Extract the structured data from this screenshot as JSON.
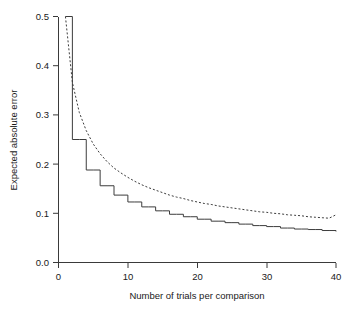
{
  "chart_data": {
    "type": "line",
    "title": "",
    "xlabel": "Number of trials per comparison",
    "ylabel": "Expected absolute error",
    "xlim": [
      0,
      40
    ],
    "ylim": [
      0.0,
      0.5
    ],
    "xticks": [
      0,
      10,
      20,
      30,
      40
    ],
    "xtick_labels": [
      "0",
      "10",
      "20",
      "30",
      "40"
    ],
    "yticks": [
      0.0,
      0.1,
      0.2,
      0.3,
      0.4,
      0.5
    ],
    "ytick_labels": [
      "0.0",
      "0.1",
      "0.2",
      "0.3",
      "0.4",
      "0.5"
    ],
    "grid": false,
    "legend": "none",
    "x": [
      1,
      2,
      3,
      4,
      5,
      6,
      7,
      8,
      9,
      10,
      11,
      12,
      13,
      14,
      15,
      16,
      17,
      18,
      19,
      20,
      21,
      22,
      23,
      24,
      25,
      26,
      27,
      28,
      29,
      30,
      31,
      32,
      33,
      34,
      35,
      36,
      37,
      38,
      39,
      40
    ],
    "series": [
      {
        "name": "exact (step function)",
        "style": "solid",
        "step": true,
        "values": [
          0.5,
          0.25,
          0.25,
          0.188,
          0.188,
          0.156,
          0.156,
          0.137,
          0.137,
          0.123,
          0.123,
          0.113,
          0.113,
          0.105,
          0.105,
          0.098,
          0.098,
          0.093,
          0.093,
          0.088,
          0.088,
          0.084,
          0.084,
          0.081,
          0.081,
          0.078,
          0.078,
          0.075,
          0.075,
          0.073,
          0.073,
          0.07,
          0.07,
          0.068,
          0.068,
          0.067,
          0.067,
          0.065,
          0.065,
          0.063
        ]
      },
      {
        "name": "approximation (smooth)",
        "style": "dashed",
        "step": false,
        "values": [
          0.5,
          0.366,
          0.305,
          0.268,
          0.241,
          0.221,
          0.205,
          0.192,
          0.182,
          0.173,
          0.165,
          0.158,
          0.152,
          0.147,
          0.142,
          0.137,
          0.133,
          0.13,
          0.126,
          0.123,
          0.12,
          0.118,
          0.115,
          0.113,
          0.111,
          0.109,
          0.107,
          0.105,
          0.103,
          0.102,
          0.1,
          0.099,
          0.097,
          0.096,
          0.095,
          0.093,
          0.092,
          0.091,
          0.09,
          0.097
        ]
      }
    ]
  },
  "axes": {
    "y_title": "Expected absolute error",
    "x_title": "Number of trials per comparison"
  }
}
